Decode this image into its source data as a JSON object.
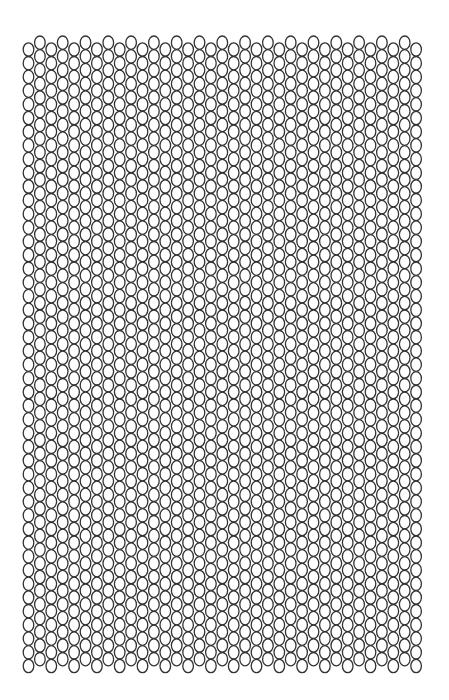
{
  "pattern": {
    "type": "peyote-bead-grid",
    "columns": 35,
    "rows": 46,
    "origin_x": 28.5,
    "origin_y": 49.5,
    "pitch_x": 11.4,
    "pitch_y": 13.7,
    "stagger_y": -6.8,
    "bead_rx": 5.3,
    "bead_ry": 6.7,
    "stroke_color": "#333333",
    "fill_color": "#ffffff",
    "stroke_width": 1.3
  }
}
